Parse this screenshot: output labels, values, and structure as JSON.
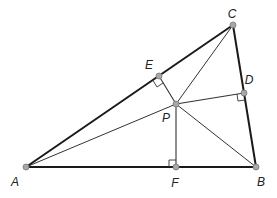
{
  "colors": {
    "stroke": "#1a1a1a",
    "thin_stroke": "#333333",
    "point_fill": "#a8a8a8",
    "point_stroke": "#777777",
    "background": "#ffffff"
  },
  "points": {
    "A": {
      "label": "A",
      "x": 26,
      "y": 167,
      "label_x": 15,
      "label_y": 182
    },
    "B": {
      "label": "B",
      "x": 256,
      "y": 167,
      "label_x": 261,
      "label_y": 182
    },
    "C": {
      "label": "C",
      "x": 233,
      "y": 25,
      "label_x": 232,
      "label_y": 14
    },
    "D": {
      "label": "D",
      "x": 244,
      "y": 93,
      "label_x": 249,
      "label_y": 80
    },
    "E": {
      "label": "E",
      "x": 159,
      "y": 76,
      "label_x": 149,
      "label_y": 65
    },
    "F": {
      "label": "F",
      "x": 176,
      "y": 167,
      "label_x": 175,
      "label_y": 183
    },
    "P": {
      "label": "P",
      "x": 176,
      "y": 104,
      "label_x": 166,
      "label_y": 118
    }
  },
  "triangle_sides": [
    [
      "A",
      "B"
    ],
    [
      "B",
      "C"
    ],
    [
      "C",
      "A"
    ]
  ],
  "cevians": [
    [
      "P",
      "A"
    ],
    [
      "P",
      "B"
    ],
    [
      "P",
      "C"
    ]
  ],
  "perpendiculars": [
    {
      "from": "P",
      "to": "D",
      "side": "BC"
    },
    {
      "from": "P",
      "to": "E",
      "side": "CA"
    },
    {
      "from": "P",
      "to": "F",
      "side": "AB"
    }
  ],
  "right_angle_markers": [
    "D",
    "E",
    "F"
  ]
}
